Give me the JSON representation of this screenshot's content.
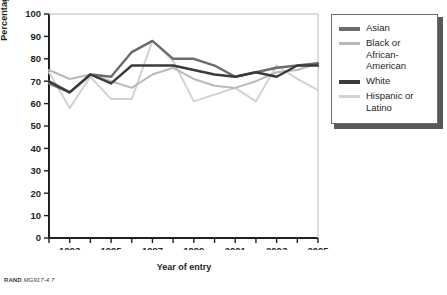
{
  "figure": {
    "source_note_prefix": "RAND",
    "source_note_code": "MG917-4.7"
  },
  "legend": {
    "items": [
      {
        "label": "Asian",
        "color": "#6b6b6b",
        "weight": "thick"
      },
      {
        "label": "Black or\nAfrican-\nAmerican",
        "color": "#b9b9b9",
        "weight": "thin"
      },
      {
        "label": "White",
        "color": "#3a3a3a",
        "weight": "thick"
      },
      {
        "label": "Hispanic or\nLatino",
        "color": "#d2d2d2",
        "weight": "thin"
      }
    ]
  },
  "chart_data": {
    "type": "line",
    "title": "",
    "xlabel": "Year of entry",
    "ylabel": "Percentage",
    "xlim": [
      1992,
      2005
    ],
    "ylim": [
      0,
      100
    ],
    "ytick_values": [
      0,
      10,
      20,
      30,
      40,
      50,
      60,
      70,
      80,
      90,
      100
    ],
    "ytick_labels": [
      "0",
      "10",
      "20",
      "30",
      "40",
      "50",
      "60",
      "70",
      "80",
      "90",
      "100"
    ],
    "xtick_values": [
      1992,
      1993,
      1994,
      1995,
      1996,
      1997,
      1998,
      1999,
      2000,
      2001,
      2002,
      2003,
      2004,
      2005
    ],
    "xtick_labels": [
      "",
      "1993",
      "",
      "1995",
      "",
      "1997",
      "",
      "1999",
      "",
      "2001",
      "",
      "2003",
      "",
      "2005"
    ],
    "grid": false,
    "legend_position": "right",
    "x": [
      1992,
      1993,
      1994,
      1995,
      1996,
      1997,
      1998,
      1999,
      2000,
      2001,
      2002,
      2003,
      2004,
      2005
    ],
    "series": [
      {
        "name": "Asian",
        "color": "#6b6b6b",
        "values": [
          69,
          65,
          73,
          72,
          83,
          88,
          80,
          80,
          77,
          72,
          74,
          76,
          77,
          78
        ]
      },
      {
        "name": "Black or African-American",
        "color": "#b9b9b9",
        "values": [
          75,
          71,
          73,
          70,
          67,
          73,
          76,
          71,
          68,
          67,
          70,
          74,
          75,
          78
        ]
      },
      {
        "name": "White",
        "color": "#3a3a3a",
        "values": [
          70,
          65,
          73,
          69,
          77,
          77,
          77,
          75,
          73,
          72,
          74,
          72,
          77,
          77
        ]
      },
      {
        "name": "Hispanic or Latino",
        "color": "#d2d2d2",
        "values": [
          74,
          58,
          72,
          62,
          62,
          88,
          79,
          61,
          64,
          67,
          61,
          77,
          71,
          66
        ]
      }
    ]
  }
}
